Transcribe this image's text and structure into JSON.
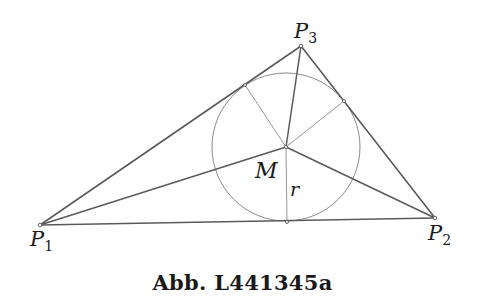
{
  "figure": {
    "caption": "Abb. L441345a"
  },
  "points": {
    "P1": {
      "label": "P",
      "sub": "1",
      "x": 40,
      "y": 225
    },
    "P2": {
      "label": "P",
      "sub": "2",
      "x": 435,
      "y": 218
    },
    "P3": {
      "label": "P",
      "sub": "3",
      "x": 301,
      "y": 46
    },
    "M": {
      "label": "M",
      "x": 286,
      "y": 147
    }
  },
  "incircle": {
    "cx": 286,
    "cy": 147,
    "r": 74
  },
  "tangent_points": [
    {
      "name": "T12",
      "x": 287,
      "y": 222
    },
    {
      "name": "T13",
      "x": 245,
      "y": 85
    },
    {
      "name": "T23",
      "x": 344,
      "y": 101
    }
  ],
  "labels": {
    "P1_main": "P",
    "P1_sub": "1",
    "P2_main": "P",
    "P2_sub": "2",
    "P3_main": "P",
    "P3_sub": "3",
    "M": "M",
    "r": "r"
  },
  "colors": {
    "edge": "#5a5a5a",
    "thin": "#8a8a8a",
    "text": "#1a1a1a"
  }
}
